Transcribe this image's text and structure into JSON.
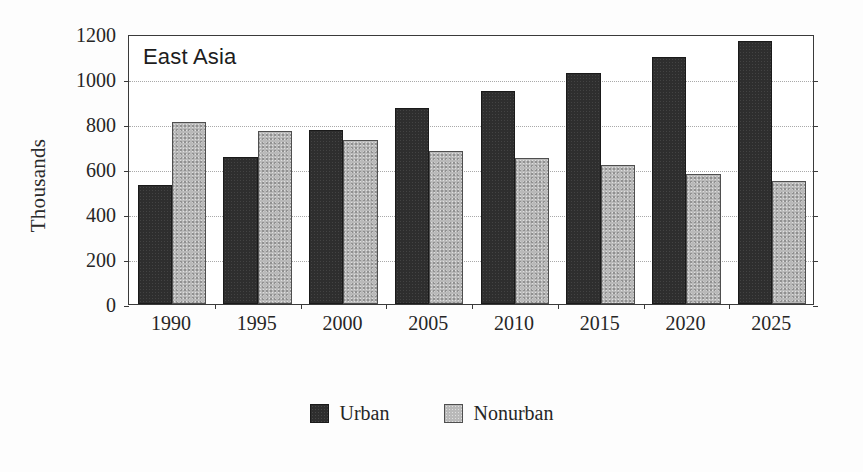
{
  "chart_data": {
    "type": "bar",
    "title": "East Asia",
    "xlabel": "",
    "ylabel": "Thousands",
    "ylim": [
      0,
      1200
    ],
    "ytick_step": 200,
    "yticks": [
      0,
      200,
      400,
      600,
      800,
      1000,
      1200
    ],
    "ytick_labels": [
      "0",
      "200",
      "400",
      "600",
      "800",
      "1000",
      "1200"
    ],
    "categories": [
      "1990",
      "1995",
      "2000",
      "2005",
      "2010",
      "2015",
      "2020",
      "2025"
    ],
    "series": [
      {
        "name": "Urban",
        "color": "#2e2e2e",
        "values": [
          530,
          652,
          775,
          872,
          945,
          1027,
          1098,
          1168
        ]
      },
      {
        "name": "Nonurban",
        "color": "#b9b9b9",
        "values": [
          808,
          770,
          728,
          682,
          648,
          617,
          580,
          548
        ]
      }
    ],
    "grid": true,
    "grid_style": "dotted",
    "legend_position": "bottom-center"
  },
  "axes": {
    "y_title": "Thousands"
  },
  "legend": {
    "items": [
      {
        "label": "Urban",
        "swatch": "urban"
      },
      {
        "label": "Nonurban",
        "swatch": "nonurban"
      }
    ]
  }
}
